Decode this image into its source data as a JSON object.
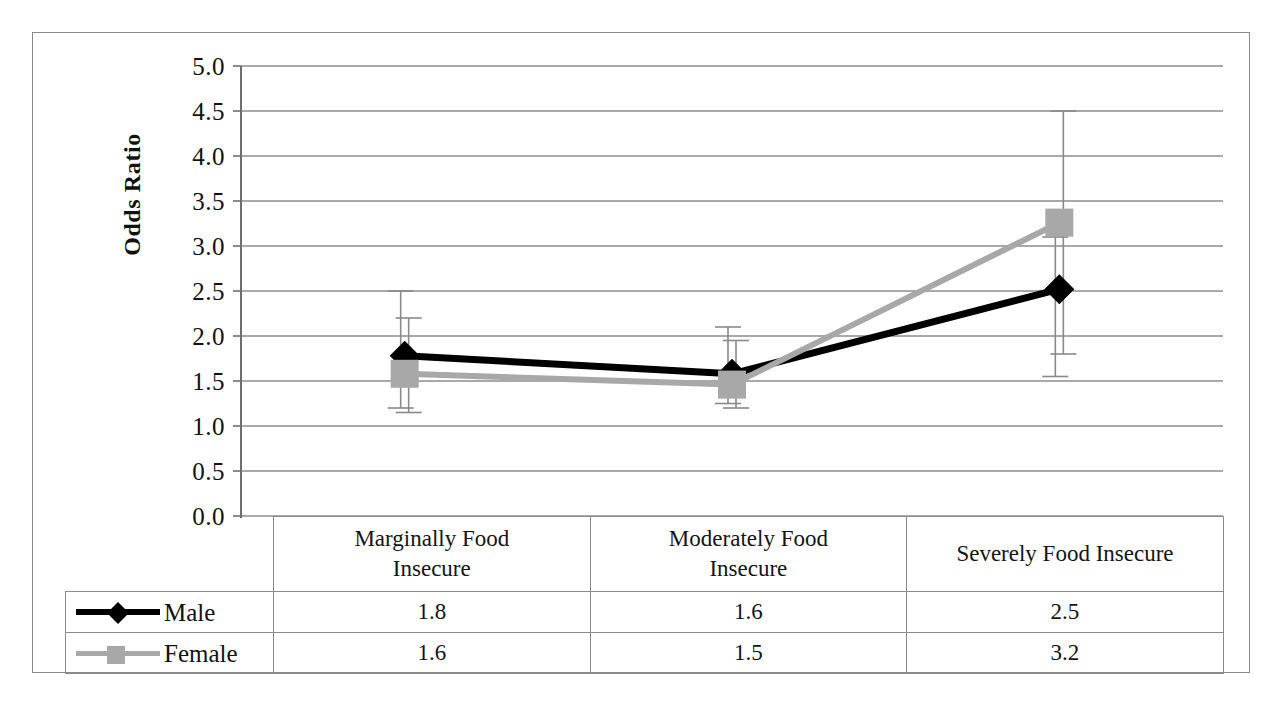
{
  "chart_data": {
    "type": "line",
    "title": "",
    "xlabel": "",
    "ylabel": "Odds Ratio",
    "ylim": [
      0.0,
      5.0
    ],
    "ytick_step": 0.5,
    "grid": true,
    "legend_position": "table-left-column",
    "categories": [
      "Marginally Food\nInsecure",
      "Moderately Food\nInsecure",
      "Severely Food Insecure"
    ],
    "category_labels_flat": [
      "Marginally Food Insecure",
      "Moderately Food Insecure",
      "Severely Food Insecure"
    ],
    "yticks": [
      "5.0",
      "4.5",
      "4.0",
      "3.5",
      "3.0",
      "2.5",
      "2.0",
      "1.5",
      "1.0",
      "0.5",
      "0.0"
    ],
    "series": [
      {
        "name": "Male",
        "marker": "diamond",
        "color": "#000000",
        "values": [
          1.8,
          1.6,
          2.5
        ],
        "plotted_values": [
          1.78,
          1.58,
          2.52
        ],
        "error_low": [
          1.2,
          1.25,
          1.55
        ],
        "error_high": [
          2.5,
          2.1,
          3.1
        ],
        "table_values": [
          "1.8",
          "1.6",
          "2.5"
        ]
      },
      {
        "name": "Female",
        "marker": "square",
        "color": "#a8a8a8",
        "values": [
          1.6,
          1.5,
          3.2
        ],
        "plotted_values": [
          1.58,
          1.46,
          3.26
        ],
        "error_low": [
          1.15,
          1.2,
          1.8
        ],
        "error_high": [
          2.2,
          1.95,
          4.5
        ],
        "table_values": [
          "1.6",
          "1.5",
          "3.2"
        ]
      }
    ]
  },
  "table": {
    "legend_column_header": "",
    "row_labels": [
      "Male",
      "Female"
    ]
  },
  "colors": {
    "male": "#000000",
    "female": "#a8a8a8",
    "grid": "#8c8c8c",
    "axis": "#6e6e6e",
    "border": "#8a8a8a",
    "errorbar": "#8a8a8a",
    "background": "#ffffff"
  },
  "icons": {
    "male_marker": "diamond-marker-icon",
    "female_marker": "square-marker-icon"
  }
}
